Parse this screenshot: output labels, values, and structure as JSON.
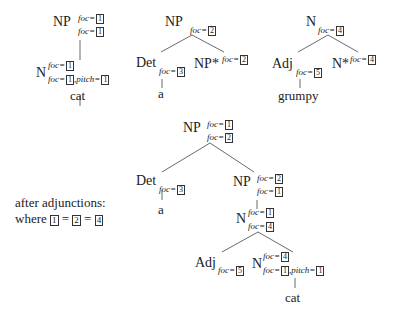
{
  "tree1": {
    "root": {
      "label": "NP",
      "top": "foc=",
      "top_box": "1",
      "bot": "foc=",
      "bot_box": "1"
    },
    "child": {
      "label": "N",
      "top": "foc=",
      "top_box": "1",
      "bot": "foc=",
      "bot_box": "1",
      "bot2": ",pitch=",
      "bot2_box": "1"
    },
    "word": "cat"
  },
  "tree2": {
    "root": {
      "label": "NP",
      "bot": "foc=",
      "bot_box": "2"
    },
    "det": {
      "label": "Det",
      "bot": "foc=",
      "bot_box": "3"
    },
    "foot": {
      "label": "NP*",
      "top": "foc=",
      "top_box": "2"
    },
    "word": "a"
  },
  "tree3": {
    "root": {
      "label": "N",
      "bot": "foc=",
      "bot_box": "4"
    },
    "adj": {
      "label": "Adj",
      "bot": "foc=",
      "bot_box": "5"
    },
    "foot": {
      "label": "N*",
      "top": "foc=",
      "top_box": "4"
    },
    "word": "grumpy"
  },
  "derived": {
    "root": {
      "label": "NP",
      "top": "foc=",
      "top_box": "1",
      "bot": "foc=",
      "bot_box": "2"
    },
    "det": {
      "label": "Det",
      "bot": "foc=",
      "bot_box": "3"
    },
    "det_word": "a",
    "np": {
      "label": "NP",
      "top": "foc=",
      "top_box": "2",
      "bot": "foc=",
      "bot_box": "1"
    },
    "n": {
      "label": "N",
      "top": "foc=",
      "top_box": "1",
      "bot": "foc=",
      "bot_box": "4"
    },
    "adj": {
      "label": "Adj",
      "bot": "foc=",
      "bot_box": "5"
    },
    "n2": {
      "label": "N",
      "top": "foc=",
      "top_box": "4",
      "bot": "foc=",
      "bot_box": "1",
      "bot2": ",pitch=",
      "bot2_box": "1"
    },
    "word": "cat"
  },
  "note": {
    "line1": "after adjunctions:",
    "line2_prefix": "where",
    "box1": "1",
    "eq1": "=",
    "box2": "2",
    "eq2": "=",
    "box3": "4"
  }
}
